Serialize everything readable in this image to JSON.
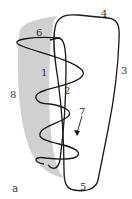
{
  "figure": {
    "panel_label": "a",
    "labels": [
      {
        "id": "1",
        "text": "1"
      },
      {
        "id": "2",
        "text": "2"
      },
      {
        "id": "3",
        "text": "3"
      },
      {
        "id": "4",
        "text": "4"
      },
      {
        "id": "5",
        "text": "5"
      },
      {
        "id": "6",
        "text": "6"
      },
      {
        "id": "7",
        "text": "7"
      },
      {
        "id": "8",
        "text": "8"
      }
    ],
    "colors": {
      "outline": "#1a1a1a",
      "shading": "#c8c8c8",
      "label": "#333333"
    }
  }
}
